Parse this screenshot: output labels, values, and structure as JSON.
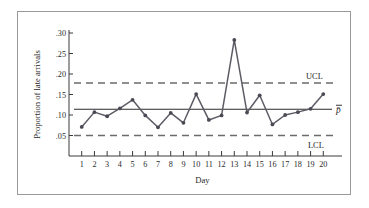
{
  "chart_data": {
    "type": "line",
    "title": "",
    "subtitle": "",
    "xlabel": "Day",
    "ylabel": "Proportion of late arrivals",
    "x": [
      1,
      2,
      3,
      4,
      5,
      6,
      7,
      8,
      9,
      10,
      11,
      12,
      13,
      14,
      15,
      16,
      17,
      18,
      19,
      20
    ],
    "xtick_labels": [
      "1",
      "2",
      "3",
      "4",
      "5",
      "6",
      "7",
      "8",
      "9",
      "10",
      "11",
      "12",
      "13",
      "14",
      "15",
      "16",
      "17",
      "18",
      "19",
      "20"
    ],
    "values": [
      0.071,
      0.107,
      0.097,
      0.116,
      0.137,
      0.099,
      0.07,
      0.105,
      0.081,
      0.151,
      0.088,
      0.099,
      0.283,
      0.106,
      0.148,
      0.077,
      0.1,
      0.107,
      0.115,
      0.151
    ],
    "ylim": [
      0.0,
      0.3
    ],
    "ytick_values": [
      0.05,
      0.1,
      0.15,
      0.2,
      0.25,
      0.3
    ],
    "ytick_labels": [
      ".05",
      ".10",
      ".15",
      ".20",
      ".25",
      ".30"
    ],
    "xlim": [
      0,
      21
    ],
    "grid": false,
    "legend": false,
    "marker": "circle",
    "series_color": "#5c5c66",
    "reference_lines": [
      {
        "name": "upper-control-limit",
        "label": "UCL",
        "value": 0.178,
        "style": "dashed",
        "color": "#6b6b6b"
      },
      {
        "name": "center-line",
        "label": "p̄",
        "value": 0.114,
        "style": "solid",
        "color": "#2b2b2b"
      },
      {
        "name": "lower-control-limit",
        "label": "LCL",
        "value": 0.05,
        "style": "dashed",
        "color": "#6b6b6b"
      }
    ]
  },
  "figure": {
    "frame_color": "#9a9a9a",
    "background": "#ffffff"
  }
}
